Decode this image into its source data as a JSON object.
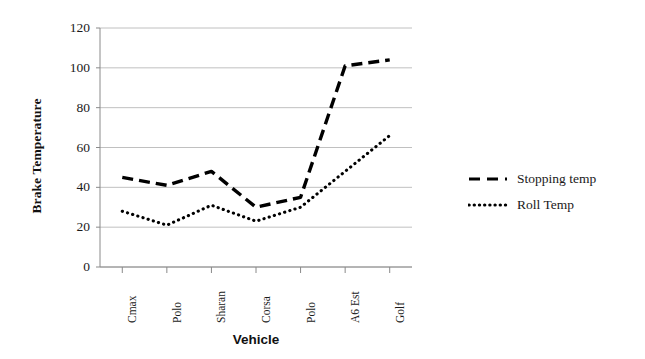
{
  "chart_data": {
    "type": "line",
    "title": "",
    "xlabel": "Vehicle",
    "ylabel": "Brake Temperature",
    "categories": [
      "Cmax",
      "Polo",
      "Sharan",
      "Corsa",
      "Polo",
      "A6 Est",
      "Golf"
    ],
    "series": [
      {
        "name": "Stopping temp",
        "style": "dashed",
        "values": [
          45,
          41,
          48,
          30,
          35,
          101,
          104
        ]
      },
      {
        "name": "Roll Temp",
        "style": "dotted",
        "values": [
          28,
          21,
          31,
          23,
          30,
          48,
          66
        ]
      }
    ],
    "ylim": [
      0,
      120
    ],
    "y_ticks": [
      "0",
      "20",
      "40",
      "60",
      "80",
      "100",
      "120"
    ],
    "y_tick_values": [
      0,
      20,
      40,
      60,
      80,
      100,
      120
    ],
    "grid": "horizontal",
    "legend_position": "right"
  },
  "legend": {
    "items": [
      {
        "label": "Stopping temp",
        "style": "dashed"
      },
      {
        "label": "Roll Temp",
        "style": "dotted"
      }
    ]
  },
  "colors": {
    "line": "#000000",
    "grid": "#b9b9b9",
    "axis": "#8a8a8a",
    "text": "#1a1a1a",
    "background": "#ffffff"
  }
}
